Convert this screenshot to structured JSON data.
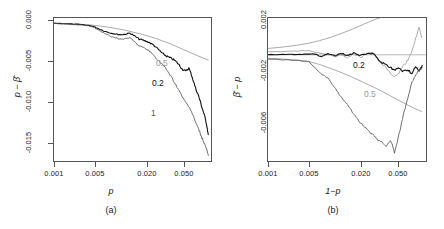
{
  "figure": {
    "panels": [
      {
        "caption": "(a)",
        "xlabel": "p",
        "ylabel": "p − β̂",
        "xticks": [
          "0.001",
          "0.005",
          "0.020",
          "0.050"
        ],
        "yticks": [
          "0.000",
          "-0.005",
          "-0.010",
          "-0.015"
        ],
        "series_labels": [
          {
            "text": "0.5",
            "color": "#9a9a9a"
          },
          {
            "text": "0.2",
            "color": "#111111"
          },
          {
            "text": "1",
            "color": "#555555"
          }
        ]
      },
      {
        "caption": "(b)",
        "xlabel": "1−p",
        "ylabel": "β̂ − p",
        "xticks": [
          "0.001",
          "0.005",
          "0.020",
          "0.050"
        ],
        "yticks": [
          "0.002",
          "-0.002",
          "-0.006"
        ],
        "series_labels": [
          {
            "text": "0.2",
            "color": "#111111"
          },
          {
            "text": "0.5",
            "color": "#9a9a9a"
          }
        ]
      }
    ]
  },
  "chart_data": [
    {
      "type": "line",
      "panel": "(a)",
      "title": "",
      "xlabel": "p",
      "ylabel": "p − β̂",
      "xscale": "log",
      "xlim": [
        0.001,
        0.07
      ],
      "ylim": [
        -0.0175,
        0.0005
      ],
      "xticks": [
        0.001,
        0.005,
        0.02,
        0.05
      ],
      "xticklabels": [
        "0.001",
        "0.005",
        "0.020",
        "0.050"
      ],
      "yticks": [
        0.0,
        -0.005,
        -0.01,
        -0.015
      ],
      "yticklabels": [
        "0.000",
        "-0.005",
        "-0.010",
        "-0.015"
      ],
      "grid": false,
      "legend": "inline-annotations",
      "series": [
        {
          "name": "0.5",
          "color": "#9a9a9a",
          "x": [
            0.001,
            0.0013,
            0.0017,
            0.0022,
            0.0028,
            0.0035,
            0.0045,
            0.0055,
            0.007,
            0.0085,
            0.0105,
            0.013,
            0.016,
            0.019,
            0.023,
            0.027,
            0.032,
            0.038,
            0.044,
            0.05,
            0.057,
            0.065
          ],
          "y": [
            -0.00015,
            -0.0002,
            -0.00026,
            -0.00032,
            -0.0004,
            -0.00052,
            -0.00068,
            -0.00085,
            -0.00105,
            -0.00128,
            -0.00152,
            -0.0018,
            -0.0021,
            -0.0024,
            -0.00272,
            -0.00305,
            -0.0034,
            -0.00375,
            -0.00405,
            -0.0043,
            -0.00455,
            -0.0048
          ]
        },
        {
          "name": "0.2",
          "color": "#111111",
          "x": [
            0.001,
            0.0013,
            0.0017,
            0.0022,
            0.0028,
            0.0032,
            0.0038,
            0.0045,
            0.0052,
            0.006,
            0.0068,
            0.0078,
            0.0088,
            0.01,
            0.0115,
            0.013,
            0.0148,
            0.017,
            0.019,
            0.021,
            0.0235,
            0.026,
            0.029,
            0.032,
            0.035,
            0.0385,
            0.042,
            0.046,
            0.05,
            0.054,
            0.058,
            0.062,
            0.065
          ],
          "y": [
            -0.00015,
            -0.0002,
            -0.00028,
            -0.00036,
            -0.0005,
            -0.00075,
            -0.0011,
            -0.00135,
            -0.0015,
            -0.0016,
            -0.00155,
            -0.0014,
            -0.00175,
            -0.00215,
            -0.00235,
            -0.00255,
            -0.0029,
            -0.0035,
            -0.004,
            -0.0043,
            -0.00455,
            -0.0048,
            -0.0053,
            -0.0059,
            -0.0062,
            -0.0058,
            -0.0069,
            -0.0083,
            -0.0093,
            -0.0105,
            -0.0116,
            -0.0128,
            -0.0142
          ]
        },
        {
          "name": "1",
          "color": "#555555",
          "x": [
            0.001,
            0.0013,
            0.0017,
            0.0022,
            0.0028,
            0.0032,
            0.0038,
            0.0045,
            0.0052,
            0.006,
            0.0068,
            0.0078,
            0.0088,
            0.01,
            0.0115,
            0.013,
            0.0148,
            0.017,
            0.019,
            0.021,
            0.0235,
            0.026,
            0.029,
            0.032,
            0.035,
            0.0385,
            0.042,
            0.046,
            0.05,
            0.054,
            0.058,
            0.062,
            0.065
          ],
          "y": [
            -0.00018,
            -0.00024,
            -0.00032,
            -0.00042,
            -0.00058,
            -0.0009,
            -0.00135,
            -0.00175,
            -0.00195,
            -0.00215,
            -0.0021,
            -0.002,
            -0.0025,
            -0.003,
            -0.0033,
            -0.0036,
            -0.0042,
            -0.0049,
            -0.0054,
            -0.006,
            -0.0068,
            -0.0076,
            -0.0085,
            -0.0094,
            -0.0101,
            -0.0106,
            -0.0115,
            -0.0126,
            -0.0135,
            -0.0144,
            -0.0152,
            -0.016,
            -0.0168
          ]
        }
      ],
      "annotations": [
        {
          "text": "0.5",
          "x": 0.036,
          "y": -0.0048
        },
        {
          "text": "0.2",
          "x": 0.034,
          "y": -0.0072
        },
        {
          "text": "1",
          "x": 0.033,
          "y": -0.0108
        }
      ]
    },
    {
      "type": "line",
      "panel": "(b)",
      "title": "",
      "xlabel": "1−p",
      "ylabel": "β̂ − p",
      "xscale": "log",
      "xlim": [
        0.001,
        0.07
      ],
      "ylim": [
        -0.0075,
        0.0026
      ],
      "xticks": [
        0.001,
        0.005,
        0.02,
        0.05
      ],
      "xticklabels": [
        "0.001",
        "0.005",
        "0.020",
        "0.050"
      ],
      "yticks": [
        0.002,
        -0.002,
        -0.006
      ],
      "yticklabels": [
        "0.002",
        "-0.002",
        "-0.006"
      ],
      "grid": false,
      "legend": "inline-annotations",
      "series": [
        {
          "name": "upper-envelope",
          "color": "#9a9a9a",
          "x": [
            0.001,
            0.0015,
            0.0022,
            0.003,
            0.004,
            0.0055,
            0.0075,
            0.01,
            0.013,
            0.017,
            0.021,
            0.025
          ],
          "y": [
            0.00045,
            0.00055,
            0.00068,
            0.00082,
            0.001,
            0.00125,
            0.00155,
            0.00185,
            0.00215,
            0.00245,
            0.00265,
            0.0028
          ]
        },
        {
          "name": "0.5",
          "color": "#9a9a9a",
          "x": [
            0.001,
            0.0015,
            0.0022,
            0.003,
            0.0035,
            0.0042,
            0.005,
            0.006,
            0.007,
            0.0085,
            0.01,
            0.012,
            0.0145,
            0.017,
            0.019,
            0.021,
            0.024,
            0.027,
            0.03,
            0.034,
            0.038,
            0.043,
            0.048,
            0.053,
            0.058,
            0.063
          ],
          "y": [
            0.00022,
            0.00024,
            0.00026,
            0.00028,
            0.0002,
            0.0001,
            5e-05,
            -0.00012,
            2e-05,
            -0.0002,
            8e-05,
            -0.00018,
            0.0001,
            0.00015,
            -0.00025,
            -0.0006,
            -0.0009,
            -0.00135,
            -0.0016,
            -0.00125,
            -0.0008,
            -0.0004,
            0.00025,
            0.0012,
            0.0019,
            0.0012
          ]
        },
        {
          "name": "0.2",
          "color": "#111111",
          "x": [
            0.001,
            0.0015,
            0.0022,
            0.003,
            0.0035,
            0.0042,
            0.005,
            0.006,
            0.007,
            0.0085,
            0.01,
            0.012,
            0.0145,
            0.017,
            0.019,
            0.021,
            0.024,
            0.027,
            0.03,
            0.034,
            0.038,
            0.043,
            0.048,
            0.053,
            0.058,
            0.063
          ],
          "y": [
            2e-05,
            2e-05,
            3e-05,
            4e-05,
            6e-05,
            -0.00012,
            8e-05,
            -8e-05,
            0.00012,
            -4e-05,
            0.00014,
            -6e-05,
            6e-05,
            0.0001,
            -0.0003,
            -0.00055,
            -0.0007,
            -0.0009,
            -0.0011,
            -0.00095,
            -0.0012,
            -0.00105,
            -0.00135,
            -0.00085,
            -0.0012,
            -0.00075
          ]
        },
        {
          "name": "0.5-lower-envelope",
          "color": "#9a9a9a",
          "x": [
            0.001,
            0.0015,
            0.0022,
            0.003,
            0.004,
            0.0055,
            0.0075,
            0.01,
            0.013,
            0.017,
            0.021,
            0.026,
            0.032,
            0.04,
            0.05,
            0.062
          ],
          "y": [
            -0.00025,
            -0.0003,
            -0.00038,
            -0.00048,
            -0.00068,
            -0.00098,
            -0.0013,
            -0.00162,
            -0.00195,
            -0.00228,
            -0.00255,
            -0.00285,
            -0.00315,
            -0.00345,
            -0.00375,
            -0.004
          ]
        },
        {
          "name": "1",
          "color": "#555555",
          "x": [
            0.001,
            0.0015,
            0.0022,
            0.003,
            0.0035,
            0.0042,
            0.005,
            0.006,
            0.007,
            0.0085,
            0.01,
            0.012,
            0.0145,
            0.017,
            0.019,
            0.021,
            0.024,
            0.027,
            0.03,
            0.034,
            0.038,
            0.043,
            0.048,
            0.053,
            0.058,
            0.063
          ],
          "y": [
            -0.0003,
            -0.00035,
            -0.0004,
            -0.00048,
            -0.0009,
            -0.00135,
            -0.00165,
            -0.0023,
            -0.0029,
            -0.0035,
            -0.0042,
            -0.0048,
            -0.0053,
            -0.0057,
            -0.006,
            -0.0061,
            -0.0065,
            -0.006,
            -0.0069,
            -0.0056,
            -0.0043,
            -0.003,
            -0.00195,
            -0.0014,
            -0.0011,
            -0.0009
          ]
        }
      ],
      "annotations": [
        {
          "text": "0.2",
          "x": 0.024,
          "y": -0.00055
        },
        {
          "text": "0.5",
          "x": 0.03,
          "y": -0.00215
        },
        {
          "text": "1",
          "x": 0.034,
          "y": -0.0069
        }
      ],
      "reference_line": {
        "y": 0.0,
        "color": "#b9b9b9"
      }
    }
  ]
}
